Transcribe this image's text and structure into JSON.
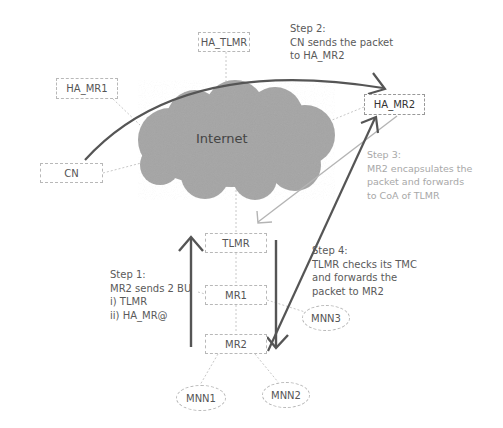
{
  "diagram": {
    "cloud_label": "Internet",
    "nodes": {
      "ha_tlmr": "HA_TLMR",
      "ha_mr1": "HA_MR1",
      "ha_mr2": "HA_MR2",
      "cn": "CN",
      "tlmr": "TLMR",
      "mr1": "MR1",
      "mr2": "MR2",
      "mnn1": "MNN1",
      "mnn2": "MNN2",
      "mnn3": "MNN3"
    },
    "steps": {
      "step1": [
        "Step 1:",
        "MR2 sends 2 BU",
        "i) TLMR",
        "ii) HA_MR@"
      ],
      "step2": [
        "Step 2:",
        "CN sends the packet",
        "to HA_MR2"
      ],
      "step3": [
        "Step 3:",
        "MR2 encapsulates the",
        "packet and forwards",
        "to CoA of TLMR"
      ],
      "step4": [
        "Step 4:",
        "TLMR checks its TMC",
        "and forwards the",
        "packet to MR2"
      ]
    },
    "colors": {
      "arrow_dark": "#555555",
      "arrow_light": "#b0b0b0",
      "cloud": "#a9a9a9",
      "box_border": "#b8b8b8"
    }
  }
}
